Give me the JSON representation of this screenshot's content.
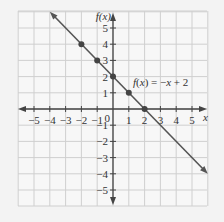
{
  "chart_data": {
    "type": "line",
    "title": "",
    "xlabel": "x",
    "ylabel": "f(x)",
    "xlim": [
      -6,
      6
    ],
    "ylim": [
      -6,
      6
    ],
    "grid": true,
    "x_ticks": [
      -5,
      -4,
      -3,
      -2,
      -1,
      1,
      2,
      3,
      4,
      5
    ],
    "y_ticks": [
      5,
      4,
      3,
      2,
      1,
      -1,
      -2,
      -3,
      -4,
      -5
    ],
    "x_tick_labels": [
      "−5",
      "−4",
      "−3",
      "−2",
      "−1",
      "1",
      "2",
      "3",
      "4",
      "5"
    ],
    "y_tick_labels": [
      "5",
      "4",
      "3",
      "2",
      "1",
      "−1",
      "−2",
      "−3",
      "−4",
      "−5"
    ],
    "origin_label": "0",
    "series": [
      {
        "name": "f(x) = −x + 2",
        "equation_label": "f(x) = −x + 2",
        "color": "#555555",
        "line_extent": {
          "x_start": -4,
          "y_start": 6,
          "x_end": 6,
          "y_end": -4
        },
        "points": [
          {
            "x": -2,
            "y": 4
          },
          {
            "x": -1,
            "y": 3
          },
          {
            "x": 0,
            "y": 2
          },
          {
            "x": 1,
            "y": 1
          },
          {
            "x": 2,
            "y": 0
          }
        ]
      }
    ]
  },
  "colors": {
    "background": "#f3f3f3",
    "grid_bg": "#f7f7f7",
    "grid_line": "#cfcfcf",
    "axis": "#444444",
    "line": "#555555",
    "point": "#444444"
  }
}
